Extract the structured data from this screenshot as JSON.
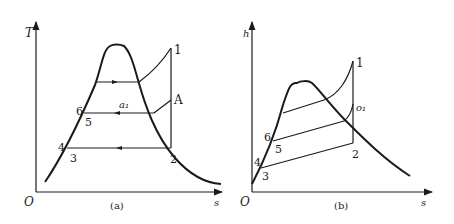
{
  "diagram_a": {
    "caption": "(a)",
    "y_axis_label": "T",
    "x_axis_label": "s",
    "origin_label": "O",
    "points": {
      "p1": "1",
      "p2": "2",
      "p3": "3",
      "p4": "4",
      "p5": "5",
      "p6": "6",
      "pA": "A",
      "pa1": "a₁"
    }
  },
  "diagram_b": {
    "caption": "(b)",
    "y_axis_label": "h",
    "x_axis_label": "s",
    "origin_label": "O",
    "points": {
      "p1": "1",
      "p2": "2",
      "p3": "3",
      "p4": "4",
      "p5": "5",
      "p6": "6",
      "po1": "o₁"
    }
  }
}
